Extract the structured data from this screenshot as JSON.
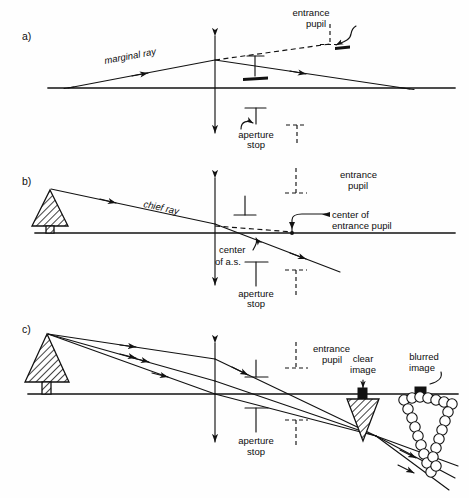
{
  "figure": {
    "type": "optical-ray-diagram",
    "background_color": "#fefefe",
    "ink_color": "#121212"
  },
  "panels": [
    {
      "letter": "a)",
      "name": "marginal-ray-panel",
      "labels": {
        "marginal_ray": "marginal ray",
        "entrance_pupil_line1": "entrance",
        "entrance_pupil_line2": "pupil",
        "aperture_stop_line1": "aperture",
        "aperture_stop_line2": "stop"
      }
    },
    {
      "letter": "b)",
      "name": "chief-ray-panel",
      "labels": {
        "chief_ray": "chief ray",
        "entrance_pupil_line1": "entrance",
        "entrance_pupil_line2": "pupil",
        "center_of_entrance_pupil_line1": "center of",
        "center_of_entrance_pupil_line2": "entrance pupil",
        "center_of_as_line1": "center",
        "center_of_as_line2": "of a.s.",
        "aperture_stop_line1": "aperture",
        "aperture_stop_line2": "stop"
      }
    },
    {
      "letter": "c)",
      "name": "image-formation-panel",
      "labels": {
        "entrance_pupil_line1": "entrance",
        "entrance_pupil_line2": "pupil",
        "aperture_stop_line1": "aperture",
        "aperture_stop_line2": "stop",
        "clear_image_line1": "clear",
        "clear_image_line2": "image",
        "blurred_image_line1": "blurred",
        "blurred_image_line2": "image"
      }
    }
  ],
  "icons": {
    "lens": "double-headed-vertical-arrow-icon",
    "object": "hatched-tree-icon",
    "aperture_stop_mark": "tee-bar-icon",
    "entrance_pupil_mark": "dashed-tee-bar-icon",
    "ray_arrow": "arrowhead-icon",
    "squiggle_pointer": "squiggly-arrow-icon",
    "blur_spot": "circle-cluster-icon"
  }
}
